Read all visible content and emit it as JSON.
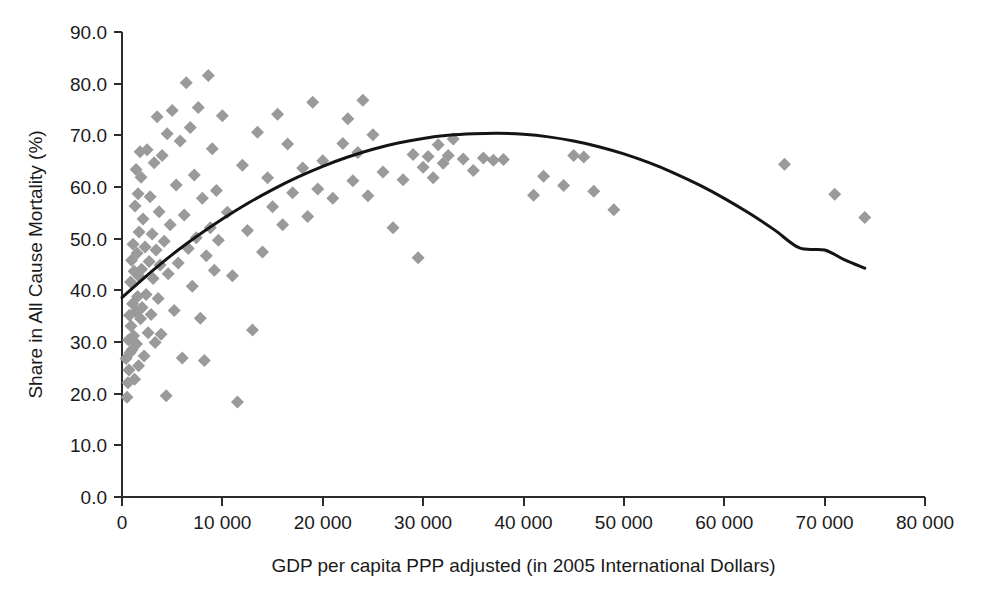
{
  "chart_data": {
    "type": "scatter",
    "title": "",
    "xlabel": "GDP per capita PPP adjusted (in 2005 International Dollars)",
    "ylabel": "Share in All Cause Mortality (%)",
    "xlim": [
      0,
      80000
    ],
    "ylim": [
      0,
      90
    ],
    "xticks": [
      0,
      10000,
      20000,
      30000,
      40000,
      50000,
      60000,
      70000,
      80000
    ],
    "xtick_labels": [
      "0",
      "10 000",
      "20 000",
      "30 000",
      "40 000",
      "50 000",
      "60 000",
      "70 000",
      "80 000"
    ],
    "yticks": [
      0,
      10,
      20,
      30,
      40,
      50,
      60,
      70,
      80,
      90
    ],
    "ytick_labels": [
      "0.0",
      "10.0",
      "20.0",
      "30.0",
      "40.0",
      "50.0",
      "60.0",
      "70.0",
      "80.0",
      "90.0"
    ],
    "grid": false,
    "legend": false,
    "marker_shape": "diamond",
    "marker_color": "#9a9a9a",
    "marker_size_px": 13,
    "curve_color": "#141414",
    "series": [
      {
        "name": "Countries",
        "points": [
          [
            400,
            26.8
          ],
          [
            500,
            19.3
          ],
          [
            600,
            22.1
          ],
          [
            650,
            30.4
          ],
          [
            700,
            24.6
          ],
          [
            750,
            35.2
          ],
          [
            800,
            27.9
          ],
          [
            850,
            41.6
          ],
          [
            900,
            33.1
          ],
          [
            950,
            45.8
          ],
          [
            1000,
            28.5
          ],
          [
            1050,
            37.4
          ],
          [
            1100,
            48.9
          ],
          [
            1150,
            31.2
          ],
          [
            1200,
            43.7
          ],
          [
            1250,
            22.8
          ],
          [
            1300,
            56.3
          ],
          [
            1350,
            35.9
          ],
          [
            1400,
            63.4
          ],
          [
            1450,
            29.6
          ],
          [
            1500,
            47.2
          ],
          [
            1550,
            38.8
          ],
          [
            1600,
            58.7
          ],
          [
            1650,
            25.4
          ],
          [
            1700,
            51.3
          ],
          [
            1750,
            42.6
          ],
          [
            1800,
            66.8
          ],
          [
            1850,
            34.5
          ],
          [
            1900,
            61.9
          ],
          [
            1950,
            44.1
          ],
          [
            2000,
            36.7
          ],
          [
            2100,
            53.8
          ],
          [
            2200,
            27.3
          ],
          [
            2300,
            48.4
          ],
          [
            2400,
            39.2
          ],
          [
            2500,
            67.2
          ],
          [
            2600,
            31.8
          ],
          [
            2700,
            45.6
          ],
          [
            2800,
            58.1
          ],
          [
            2900,
            35.3
          ],
          [
            3000,
            50.9
          ],
          [
            3100,
            42.3
          ],
          [
            3200,
            64.7
          ],
          [
            3300,
            29.9
          ],
          [
            3400,
            47.8
          ],
          [
            3500,
            73.6
          ],
          [
            3600,
            38.4
          ],
          [
            3700,
            55.2
          ],
          [
            3800,
            44.9
          ],
          [
            3900,
            31.5
          ],
          [
            4000,
            66.1
          ],
          [
            4200,
            49.5
          ],
          [
            4400,
            19.6
          ],
          [
            4500,
            70.3
          ],
          [
            4600,
            43.2
          ],
          [
            4800,
            52.7
          ],
          [
            5000,
            74.8
          ],
          [
            5200,
            36.1
          ],
          [
            5400,
            60.4
          ],
          [
            5600,
            45.3
          ],
          [
            5800,
            68.9
          ],
          [
            6000,
            26.9
          ],
          [
            6200,
            54.6
          ],
          [
            6400,
            80.2
          ],
          [
            6600,
            48.1
          ],
          [
            6800,
            71.5
          ],
          [
            7000,
            40.8
          ],
          [
            7200,
            62.3
          ],
          [
            7400,
            50.2
          ],
          [
            7600,
            75.4
          ],
          [
            7800,
            34.6
          ],
          [
            8000,
            57.8
          ],
          [
            8200,
            26.4
          ],
          [
            8400,
            46.7
          ],
          [
            8600,
            81.6
          ],
          [
            8800,
            52.1
          ],
          [
            9000,
            67.4
          ],
          [
            9200,
            43.9
          ],
          [
            9400,
            59.3
          ],
          [
            9600,
            49.7
          ],
          [
            10000,
            73.8
          ],
          [
            10500,
            55.1
          ],
          [
            11000,
            42.8
          ],
          [
            11500,
            18.4
          ],
          [
            12000,
            64.2
          ],
          [
            12500,
            51.6
          ],
          [
            13000,
            32.3
          ],
          [
            13500,
            70.6
          ],
          [
            14000,
            47.4
          ],
          [
            14500,
            61.8
          ],
          [
            15000,
            56.2
          ],
          [
            15500,
            74.1
          ],
          [
            16000,
            52.7
          ],
          [
            16500,
            68.3
          ],
          [
            17000,
            58.9
          ],
          [
            18000,
            63.7
          ],
          [
            18500,
            54.3
          ],
          [
            19000,
            76.4
          ],
          [
            19500,
            59.6
          ],
          [
            20000,
            65.1
          ],
          [
            21000,
            57.8
          ],
          [
            22000,
            68.4
          ],
          [
            22500,
            73.2
          ],
          [
            23000,
            61.2
          ],
          [
            23500,
            66.7
          ],
          [
            24000,
            76.8
          ],
          [
            24500,
            58.3
          ],
          [
            25000,
            70.1
          ],
          [
            26000,
            62.9
          ],
          [
            27000,
            52.1
          ],
          [
            28000,
            61.4
          ],
          [
            29000,
            66.3
          ],
          [
            29500,
            46.3
          ],
          [
            30000,
            63.8
          ],
          [
            30500,
            65.9
          ],
          [
            31000,
            61.8
          ],
          [
            31500,
            68.2
          ],
          [
            32000,
            64.6
          ],
          [
            32500,
            66.1
          ],
          [
            33000,
            69.3
          ],
          [
            34000,
            65.4
          ],
          [
            35000,
            63.2
          ],
          [
            36000,
            65.6
          ],
          [
            37000,
            65.2
          ],
          [
            38000,
            65.3
          ],
          [
            41000,
            58.4
          ],
          [
            42000,
            62.1
          ],
          [
            44000,
            60.3
          ],
          [
            45000,
            66.1
          ],
          [
            46000,
            65.8
          ],
          [
            47000,
            59.2
          ],
          [
            49000,
            55.6
          ],
          [
            66000,
            64.4
          ],
          [
            71000,
            58.6
          ],
          [
            74000,
            54.1
          ]
        ]
      }
    ],
    "fit_curve": {
      "name": "Quadratic fit",
      "points": [
        [
          0,
          38.6
        ],
        [
          2500,
          42.9
        ],
        [
          5000,
          46.9
        ],
        [
          7500,
          50.5
        ],
        [
          10000,
          53.8
        ],
        [
          12500,
          56.8
        ],
        [
          15000,
          59.5
        ],
        [
          17500,
          61.9
        ],
        [
          20000,
          64.0
        ],
        [
          22500,
          65.8
        ],
        [
          25000,
          67.3
        ],
        [
          27500,
          68.5
        ],
        [
          30000,
          69.4
        ],
        [
          32500,
          70.0
        ],
        [
          35000,
          70.3
        ],
        [
          37500,
          70.4
        ],
        [
          40000,
          70.2
        ],
        [
          42500,
          69.7
        ],
        [
          45000,
          68.9
        ],
        [
          47500,
          67.8
        ],
        [
          50000,
          66.4
        ],
        [
          52500,
          64.7
        ],
        [
          55000,
          62.7
        ],
        [
          57500,
          60.4
        ],
        [
          60000,
          57.8
        ],
        [
          62500,
          54.9
        ],
        [
          65000,
          51.7
        ],
        [
          67500,
          48.2
        ],
        [
          70000,
          47.8
        ],
        [
          72000,
          45.9
        ],
        [
          74000,
          44.3
        ]
      ]
    }
  }
}
